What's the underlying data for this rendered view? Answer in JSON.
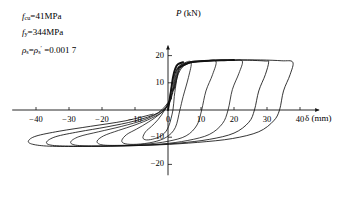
{
  "figure": {
    "name": "hysteresis-load-displacement-curve"
  },
  "annotations": {
    "lines": [
      {
        "id": "concrete-strength",
        "symbol": "f",
        "sub": "cu",
        "text": "=41MPa"
      },
      {
        "id": "steel-yield-strength",
        "symbol": "f",
        "sub": "y",
        "text": "=344MPa"
      },
      {
        "id": "reinforcement-ratio",
        "text": "=0.001 7"
      }
    ],
    "rho_prefix": "ρ",
    "rho_sub": "s",
    "rho_eq": "=",
    "rho_prime": "′"
  },
  "chart_data": {
    "type": "line",
    "title": "",
    "xlabel": "δ (mm)",
    "ylabel": "P (kN)",
    "xlim": [
      -46,
      44
    ],
    "ylim": [
      -24,
      23
    ],
    "grid": false,
    "legend": null,
    "x_ticks": [
      -40,
      -30,
      -20,
      -10,
      0,
      10,
      20,
      30,
      40
    ],
    "x_tick_labels": [
      "−40",
      "−30",
      "−20",
      "−10",
      "0",
      "10",
      "20",
      "30",
      "40"
    ],
    "y_ticks": [
      20,
      10,
      -10,
      -20
    ],
    "y_tick_labels": [
      "20",
      "10",
      "−10",
      "−20"
    ],
    "series": [
      {
        "name": "cycle-1",
        "points": [
          [
            0,
            0
          ],
          [
            1.2,
            9.5
          ],
          [
            2.0,
            13.0
          ],
          [
            3.2,
            15.5
          ],
          [
            2.6,
            11.0
          ],
          [
            1.9,
            5.0
          ],
          [
            1.5,
            0
          ],
          [
            0.2,
            -6.0
          ],
          [
            -1.5,
            -9.0
          ],
          [
            -4.0,
            -10.5
          ],
          [
            -6.5,
            -11.0
          ],
          [
            -7.6,
            -10.2
          ],
          [
            -6.8,
            -8.0
          ],
          [
            -5.0,
            -6.0
          ],
          [
            -3.0,
            -3.5
          ],
          [
            -1.0,
            0
          ],
          [
            0.6,
            4.0
          ],
          [
            1.6,
            8.0
          ]
        ]
      },
      {
        "name": "cycle-2",
        "points": [
          [
            1.0,
            4.0
          ],
          [
            1.8,
            11.0
          ],
          [
            2.6,
            15.0
          ],
          [
            4.5,
            17.0
          ],
          [
            7.0,
            17.6
          ],
          [
            6.2,
            12.0
          ],
          [
            4.6,
            5.0
          ],
          [
            3.6,
            0
          ],
          [
            2.2,
            -6.5
          ],
          [
            -0.5,
            -10.0
          ],
          [
            -4.5,
            -11.8
          ],
          [
            -9.5,
            -12.6
          ],
          [
            -13.0,
            -12.4
          ],
          [
            -14.0,
            -11.2
          ],
          [
            -12.5,
            -9.0
          ],
          [
            -9.5,
            -7.0
          ],
          [
            -6.0,
            -4.5
          ],
          [
            -2.5,
            -1.5
          ],
          [
            0.2,
            2.0
          ],
          [
            1.3,
            6.0
          ]
        ]
      },
      {
        "name": "cycle-3",
        "points": [
          [
            1.4,
            6.0
          ],
          [
            2.2,
            12.0
          ],
          [
            3.4,
            16.0
          ],
          [
            6.5,
            17.6
          ],
          [
            11.0,
            18.0
          ],
          [
            14.5,
            18.0
          ],
          [
            13.5,
            13.0
          ],
          [
            11.5,
            7.0
          ],
          [
            10.2,
            0
          ],
          [
            8.8,
            -5.5
          ],
          [
            5.5,
            -9.5
          ],
          [
            0.0,
            -11.5
          ],
          [
            -7.0,
            -12.6
          ],
          [
            -14.5,
            -13.0
          ],
          [
            -20.0,
            -12.8
          ],
          [
            -21.5,
            -11.5
          ],
          [
            -19.5,
            -9.5
          ],
          [
            -15.0,
            -7.5
          ],
          [
            -10.0,
            -5.5
          ],
          [
            -5.0,
            -3.0
          ],
          [
            -1.0,
            0
          ],
          [
            1.0,
            4.5
          ]
        ]
      },
      {
        "name": "cycle-4",
        "points": [
          [
            1.6,
            7.0
          ],
          [
            2.6,
            13.0
          ],
          [
            4.2,
            16.5
          ],
          [
            8.5,
            17.8
          ],
          [
            14.0,
            18.2
          ],
          [
            19.5,
            18.2
          ],
          [
            22.5,
            18.0
          ],
          [
            21.5,
            13.5
          ],
          [
            19.5,
            7.5
          ],
          [
            18.2,
            0
          ],
          [
            16.5,
            -5.0
          ],
          [
            12.5,
            -9.0
          ],
          [
            6.0,
            -11.2
          ],
          [
            -2.0,
            -12.5
          ],
          [
            -11.0,
            -13.0
          ],
          [
            -20.0,
            -13.2
          ],
          [
            -27.5,
            -13.0
          ],
          [
            -29.5,
            -11.8
          ],
          [
            -27.0,
            -9.8
          ],
          [
            -21.0,
            -8.0
          ],
          [
            -14.0,
            -6.0
          ],
          [
            -7.0,
            -3.5
          ],
          [
            -1.5,
            0
          ],
          [
            0.8,
            4.0
          ]
        ]
      },
      {
        "name": "cycle-5",
        "points": [
          [
            1.8,
            7.5
          ],
          [
            3.0,
            13.5
          ],
          [
            5.0,
            16.8
          ],
          [
            10.5,
            18.0
          ],
          [
            17.0,
            18.3
          ],
          [
            24.0,
            18.3
          ],
          [
            29.5,
            18.0
          ],
          [
            30.5,
            17.6
          ],
          [
            29.5,
            13.0
          ],
          [
            27.5,
            7.0
          ],
          [
            26.2,
            0
          ],
          [
            24.5,
            -4.5
          ],
          [
            20.0,
            -8.5
          ],
          [
            12.5,
            -10.8
          ],
          [
            3.0,
            -12.2
          ],
          [
            -7.5,
            -13.0
          ],
          [
            -18.0,
            -13.3
          ],
          [
            -28.0,
            -13.3
          ],
          [
            -35.0,
            -13.0
          ],
          [
            -36.8,
            -11.8
          ],
          [
            -34.0,
            -9.8
          ],
          [
            -27.0,
            -8.0
          ],
          [
            -18.5,
            -6.2
          ],
          [
            -10.0,
            -4.0
          ],
          [
            -3.0,
            -1.0
          ],
          [
            0.5,
            3.5
          ]
        ]
      },
      {
        "name": "cycle-6",
        "points": [
          [
            2.0,
            8.0
          ],
          [
            3.4,
            14.0
          ],
          [
            6.0,
            17.0
          ],
          [
            12.5,
            18.1
          ],
          [
            20.0,
            18.4
          ],
          [
            28.0,
            18.4
          ],
          [
            34.5,
            18.1
          ],
          [
            37.8,
            17.6
          ],
          [
            37.0,
            13.0
          ],
          [
            35.0,
            7.0
          ],
          [
            33.8,
            0
          ],
          [
            32.0,
            -4.0
          ],
          [
            27.5,
            -8.0
          ],
          [
            19.5,
            -10.5
          ],
          [
            9.0,
            -11.9
          ],
          [
            -2.5,
            -12.8
          ],
          [
            -14.5,
            -13.2
          ],
          [
            -26.0,
            -13.4
          ],
          [
            -36.0,
            -13.3
          ],
          [
            -41.0,
            -12.6
          ],
          [
            -42.3,
            -11.4
          ],
          [
            -40.0,
            -9.6
          ],
          [
            -33.0,
            -7.8
          ],
          [
            -23.5,
            -6.0
          ],
          [
            -13.0,
            -4.0
          ],
          [
            -4.5,
            -1.5
          ]
        ]
      }
    ],
    "envelope_positive_peak": 18.4,
    "envelope_negative_peak": -13.4,
    "max_positive_displacement": 37.8,
    "max_negative_displacement": -42.3
  }
}
